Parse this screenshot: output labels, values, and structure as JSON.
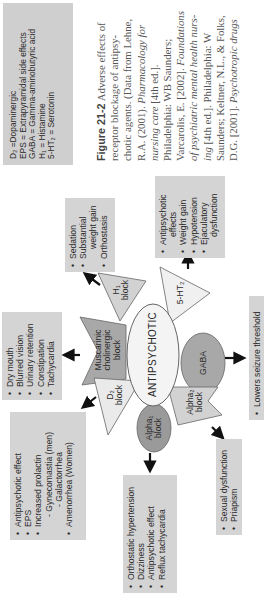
{
  "legend": {
    "items": [
      {
        "abbr": "D₂",
        "meaning": "Dopaminergic",
        "text": "D₂ =Dopaminergic"
      },
      {
        "abbr": "EPS",
        "meaning": "Extrapyramidal side effects",
        "text": "EPS = Extrapyramidal side effects"
      },
      {
        "abbr": "GABA",
        "meaning": "Gamma-aminobutyric acid",
        "text": "GABA = Gamma-aminobutyric acid"
      },
      {
        "abbr": "H₁",
        "meaning": "Histamine",
        "text": "H₁ = Histamine"
      },
      {
        "abbr": "5-HT₂",
        "meaning": "Serotonin",
        "text": "5-HT₂ = Serotonin"
      }
    ]
  },
  "center": {
    "label": "ANTIPSYCHOTIC"
  },
  "blocks": {
    "muscarinic": {
      "line1": "Muscarinic",
      "line2": "cholinergic",
      "line3": "block"
    },
    "h1": {
      "line1": "H₁",
      "line2": "block"
    },
    "ht2": {
      "line1": "5-HT₂"
    },
    "gaba": {
      "line1": "GABA"
    },
    "alpha2": {
      "line1": "Alpha₂",
      "line2": "block"
    },
    "alpha1": {
      "line1": "Alpha₁",
      "line2": "block"
    },
    "d2": {
      "line1": "D₂",
      "line2": "block"
    }
  },
  "effects": {
    "muscarinic": [
      "Dry mouth",
      "Blurred vision",
      "Urinary retention",
      "Constipation",
      "Tachycardia"
    ],
    "h1": {
      "l1": "Sedation",
      "l2": "Substantial",
      "l3": "weight gain",
      "l4": "Orthostasis"
    },
    "ht2": {
      "l1": "Antipsychotic",
      "l2": "effects",
      "l3": "Weight gain",
      "l4": "Hypotension",
      "l5": "Ejaculatory",
      "l6": "dysfunction"
    },
    "gaba": [
      "Lowers seizure threshold"
    ],
    "alpha2": [
      "Sexual dysfunction",
      "Priapism"
    ],
    "alpha1": [
      "Orthostatic hypertension",
      "Dizziness",
      "Antipsychotic effect",
      "Reflux tachycardia"
    ],
    "d2": {
      "l1": "Antipsychotic effect",
      "l2": "EPS",
      "l3": "Increased prolactin",
      "l4": "- Gynecomastia (men)",
      "l5": "- Galactorrhea",
      "l6": "Amenorrhea (Women)"
    }
  },
  "caption": {
    "figure": "Figure 21-2",
    "l1": "Adverse effects of",
    "l2": "receptor blockage of antipsy-",
    "l3": "chotic agents. (Data from Lehne,",
    "l4a": "R.A. (2001).",
    "l4b": "Pharmacology for",
    "l5a": "nursing care",
    "l5b": "[4th ed.].",
    "l6": "Philadelphia: WB Saunders;",
    "l7a": "Varcarolis, E. [2002].",
    "l7b": "Foundations",
    "l8": "of psychiatric mental health nurs-",
    "l9a": "ing",
    "l9b": "[4th ed.]. Philadelphia: W",
    "l10": "Saunders; Keltner, N.L., & Folks,",
    "l11a": "D.G. [2001].",
    "l11b": "Psychotropic drugs"
  },
  "colors": {
    "box_fill": "#d4d4d4",
    "dark_fill": "#9c9c9c",
    "light_fill": "#dcdcdc",
    "center_fill": "#f2f2f2"
  }
}
